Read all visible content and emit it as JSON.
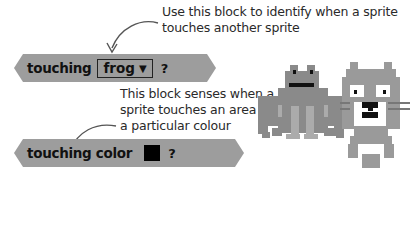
{
  "annotations": {
    "touching_sprite": [
      "Use this block to identify when a sprite",
      "touches another sprite"
    ],
    "touching_color": [
      "This block senses when a",
      "sprite touches an area of",
      "a particular colour"
    ]
  },
  "blocks": {
    "touching": {
      "label": "touching",
      "dropdown_value": "frog",
      "dropdown_arrow": "▼",
      "question": "?"
    },
    "touching_color": {
      "label": "touching color",
      "swatch_color": "#000000",
      "question": "?"
    }
  },
  "colors": {
    "block_fill": "#9d9d9d",
    "sprite_dark": "#8a8a8a",
    "sprite_light": "#a8a8a8",
    "text": "#111111"
  },
  "sprites": [
    "frog-sprite",
    "cat-sprite"
  ]
}
